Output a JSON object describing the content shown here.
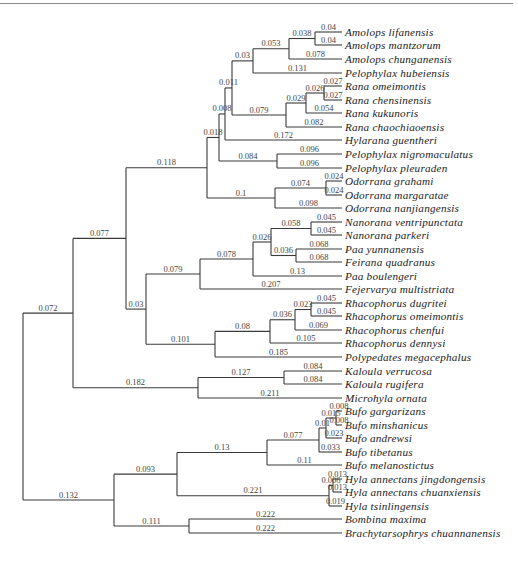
{
  "figure": {
    "type": "phylogenetic-tree",
    "layout": "rectangular cladogram, root at left",
    "branch_color": "#3a3a3a",
    "label_style": "italic serif"
  },
  "taxa": [
    {
      "id": "t0",
      "name": "Amolops lifanensis",
      "y": 32
    },
    {
      "id": "t1",
      "name": "Amolops mantzorum",
      "y": 45
    },
    {
      "id": "t2",
      "name": "Amolops chunganensis",
      "y": 59
    },
    {
      "id": "t3",
      "name": "Pelophylax hubeiensis",
      "y": 73
    },
    {
      "id": "t4",
      "name": "Rana omeimontis",
      "y": 86
    },
    {
      "id": "t5",
      "name": "Rana chensinensis",
      "y": 100
    },
    {
      "id": "t6",
      "name": "Rana kukunoris",
      "y": 113
    },
    {
      "id": "t7",
      "name": "Rana chaochiaoensis",
      "y": 127
    },
    {
      "id": "t8",
      "name": "Hylarana guentheri",
      "y": 140
    },
    {
      "id": "t9",
      "name": "Pelophylax nigromaculatus",
      "y": 154
    },
    {
      "id": "t10",
      "name": "Pelophylax pleuraden",
      "y": 168
    },
    {
      "id": "t11",
      "name": "Odorrana grahami",
      "y": 181
    },
    {
      "id": "t12",
      "name": "Odorrana margaratae",
      "y": 195
    },
    {
      "id": "t13",
      "name": "Odorrana nanjiangensis",
      "y": 208
    },
    {
      "id": "t14",
      "name": "Nanorana ventripunctata",
      "y": 222
    },
    {
      "id": "t15",
      "name": "Nanorana parkeri",
      "y": 235
    },
    {
      "id": "t16",
      "name": "Paa yunnanensis",
      "y": 249
    },
    {
      "id": "t17",
      "name": "Feirana quadranus",
      "y": 262
    },
    {
      "id": "t18",
      "name": "Paa boulengeri",
      "y": 276
    },
    {
      "id": "t19",
      "name": "Fejervarya multistriata",
      "y": 289
    },
    {
      "id": "t20",
      "name": "Rhacophorus dugritei",
      "y": 303
    },
    {
      "id": "t21",
      "name": "Rhacophorus omeimontis",
      "y": 316
    },
    {
      "id": "t22",
      "name": "Rhacophorus chenfui",
      "y": 330
    },
    {
      "id": "t23",
      "name": "Rhacophorus dennysi",
      "y": 343
    },
    {
      "id": "t24",
      "name": "Polypedates megacephalus",
      "y": 357
    },
    {
      "id": "t25",
      "name": "Kaloula verrucosa",
      "y": 371
    },
    {
      "id": "t26",
      "name": "Kaloula rugifera",
      "y": 384
    },
    {
      "id": "t27",
      "name": "Microhyla ornata",
      "y": 398
    },
    {
      "id": "t28",
      "name": "Bufo gargarizans",
      "y": 411
    },
    {
      "id": "t29",
      "name": "Bufo minshanicus",
      "y": 425
    },
    {
      "id": "t30",
      "name": "Bufo andrewsi",
      "y": 438
    },
    {
      "id": "t31",
      "name": "Bufo tibetanus",
      "y": 452
    },
    {
      "id": "t32",
      "name": "Bufo melanostictus",
      "y": 465
    },
    {
      "id": "t33",
      "name": "Hyla annectans jingdongensis",
      "y": 479
    },
    {
      "id": "t34",
      "name": "Hyla annectans chuanxiensis",
      "y": 492
    },
    {
      "id": "t35",
      "name": "Hyla tsinlingensis",
      "y": 506
    },
    {
      "id": "t36",
      "name": "Bombina maxima",
      "y": 519
    },
    {
      "id": "t37",
      "name": "Brachytarsophrys chuannanensis",
      "y": 533
    }
  ],
  "nodes": {
    "root": {
      "x": 23,
      "children": [
        "nA",
        "nB"
      ]
    },
    "nA": {
      "x": 73,
      "len": "0.072",
      "children": [
        "nC",
        "nKal"
      ]
    },
    "nB": {
      "x": 114,
      "len": "0.132",
      "children": [
        "nBH",
        "nBB"
      ]
    },
    "nC": {
      "x": 126,
      "len": "0.077",
      "children": [
        "nRan",
        "nD"
      ]
    },
    "nKal": {
      "x": 198,
      "len": "0.182",
      "children": [
        "t25",
        "t26",
        "t27"
      ]
    },
    "nRan": {
      "x": 207,
      "len": "0.118",
      "children": [
        "nE",
        "nOd"
      ]
    },
    "nD": {
      "x": 146,
      "len": "0.03",
      "children": [
        "nDic",
        "nRha"
      ]
    },
    "nE": {
      "x": 219,
      "len": "0.018",
      "children": [
        "nF",
        "nPel"
      ]
    },
    "nOd": {
      "x": 275,
      "len": "0.1",
      "children": [
        "nOd2",
        "t13"
      ]
    },
    "nF": {
      "x": 225,
      "len": "0.008",
      "children": [
        "nG",
        "t8"
      ]
    },
    "nPel": {
      "x": 277,
      "len": "0.084",
      "children": [
        "t9",
        "t10"
      ]
    },
    "nG": {
      "x": 232,
      "len": "0.011",
      "children": [
        "nAm",
        "nRa"
      ]
    },
    "nAm": {
      "x": 253,
      "len": "0.03",
      "children": [
        "nAm2",
        "t3"
      ]
    },
    "nAm2": {
      "x": 289,
      "len": "0.053",
      "children": [
        "nAm3",
        "t2"
      ]
    },
    "nAm3": {
      "x": 315,
      "len": "0.038",
      "children": [
        "t0",
        "t1"
      ]
    },
    "nRa": {
      "x": 286,
      "len": "0.079",
      "children": [
        "nRa2",
        "t7"
      ]
    },
    "nRa2": {
      "x": 306,
      "len": "0.029",
      "children": [
        "nRa3",
        "t6"
      ]
    },
    "nRa3": {
      "x": 324,
      "len": "0.026",
      "children": [
        "t4",
        "t5"
      ]
    },
    "nOd2": {
      "x": 326,
      "len": "0.074",
      "children": [
        "t11",
        "t12"
      ]
    },
    "nKal2": {
      "x": 284,
      "len": "0.127",
      "children": [
        "t25",
        "t26"
      ]
    },
    "nDic": {
      "x": 200,
      "len": "0.079",
      "children": [
        "nDic2",
        "t19"
      ]
    },
    "nDic2": {
      "x": 253,
      "len": "0.078",
      "children": [
        "nDic3",
        "t18"
      ]
    },
    "nDic3": {
      "x": 271,
      "len": "0.026",
      "children": [
        "nNan",
        "nPaa"
      ]
    },
    "nNan": {
      "x": 311,
      "len": "0.058",
      "children": [
        "t14",
        "t15"
      ]
    },
    "nPaa": {
      "x": 296,
      "len": "0.036",
      "children": [
        "t16",
        "t17"
      ]
    },
    "nRha": {
      "x": 215,
      "len": "0.101",
      "children": [
        "nRha2",
        "t24"
      ]
    },
    "nRha2": {
      "x": 270,
      "len": "0.08",
      "children": [
        "nRha3",
        "t23"
      ]
    },
    "nRha3": {
      "x": 295,
      "len": "0.036",
      "children": [
        "nRha4",
        "t22"
      ]
    },
    "nRha4": {
      "x": 311,
      "len": "0.023",
      "children": [
        "t20",
        "t21"
      ]
    },
    "nBH": {
      "x": 177,
      "len": "0.093",
      "children": [
        "nBufo",
        "nHyla"
      ]
    },
    "nBB": {
      "x": 189,
      "len": "0.111",
      "children": [
        "t36",
        "t37"
      ]
    },
    "nBufo": {
      "x": 267,
      "len": "0.13",
      "children": [
        "nBufo2",
        "t32"
      ]
    },
    "nBufo2": {
      "x": 319,
      "len": "0.077",
      "children": [
        "nBufo3",
        "t31"
      ]
    },
    "nBufo3": {
      "x": 326,
      "len": "0.01",
      "children": [
        "nBufo4",
        "nBufo5"
      ]
    },
    "nBufo4": {
      "x": 336,
      "len": "0.015",
      "children": [
        "t28",
        "t29"
      ]
    },
    "nBufo5": {
      "x": 327,
      "len": "0.023",
      "children": [
        "t30"
      ]
    },
    "nHyla": {
      "x": 329,
      "len": "0.221",
      "children": [
        "nHyla2",
        "t35"
      ]
    },
    "nHyla2": {
      "x": 333,
      "len": "0.006",
      "children": [
        "t33",
        "t34"
      ]
    }
  },
  "leaf_branch_lengths": {
    "t0": "0.04",
    "t1": "0.04",
    "t2": "0.078",
    "t3": "0.131",
    "t4": "0.027",
    "t5": "0.027",
    "t6": "0.054",
    "t7": "0.082",
    "t8": "0.172",
    "t9": "0.096",
    "t10": "0.096",
    "t11": "0.024",
    "t12": "0.024",
    "t13": "0.098",
    "t14": "0.045",
    "t15": "0.045",
    "t16": "0.068",
    "t17": "0.068",
    "t18": "0.13",
    "t19": "0.207",
    "t20": "0.045",
    "t21": "0.045",
    "t22": "0.069",
    "t23": "0.105",
    "t24": "0.185",
    "t25": "0.084",
    "t26": "0.084",
    "t27": "0.211",
    "t28": "0.008",
    "t29": "0.008",
    "t30": "0.023",
    "t31": "0.033",
    "t32": "0.11",
    "t33": "0.013",
    "t34": "0.013",
    "t35": "0.019",
    "t36": "0.222",
    "t37": "0.222"
  },
  "tip_x": 342
}
